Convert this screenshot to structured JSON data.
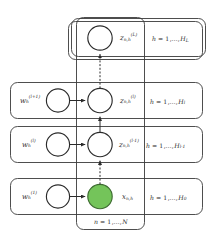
{
  "figure": {
    "type": "plate-notation-graphical-model",
    "colors": {
      "observed_node_fill": "#74c45a",
      "observed_node_stroke": "#3e6b32",
      "latent_node_fill": "#ffffff",
      "node_stroke": "#2b2b2b",
      "plate_stroke": "#3a3a3a",
      "background": "#ffffff"
    },
    "outer_plate": {
      "label_prefix": "n",
      "label_eq": "=",
      "label_start": "1",
      "label_dots": ",…,",
      "label_end": "N",
      "label_full": "n = 1,…,N"
    },
    "rows": [
      {
        "id": "layer-L",
        "weight_label": null,
        "weight_base": null,
        "weight_sub": null,
        "weight_sup": null,
        "has_weight_node": false,
        "variable_base": "z",
        "variable_sub": "n,h",
        "variable_sup": "(L)",
        "variable_full": "z_{n,h}^{(L)}",
        "observed": false,
        "plate_label_prefix": "h",
        "plate_label_eq": "=",
        "plate_label_start": "1",
        "plate_label_dots": ",…,",
        "plate_label_end": "H",
        "plate_label_end_sub": "L",
        "plate_label_full": "h = 1,…,H_L",
        "stacked": true
      },
      {
        "id": "layer-l",
        "weight_label": "w_h^{(l+1)}",
        "weight_base": "w",
        "weight_sub": "h",
        "weight_sup": "(l+1)",
        "has_weight_node": true,
        "variable_base": "z",
        "variable_sub": "n,h",
        "variable_sup": "(l)",
        "variable_full": "z_{n,h}^{(l)}",
        "observed": false,
        "plate_label_prefix": "h",
        "plate_label_eq": "=",
        "plate_label_start": "1",
        "plate_label_dots": ",…,",
        "plate_label_end": "H",
        "plate_label_end_sub": "l",
        "plate_label_full": "h = 1,…,H_l",
        "stacked": false
      },
      {
        "id": "layer-l-minus-1",
        "weight_label": "w_h^{(l)}",
        "weight_base": "w",
        "weight_sub": "h",
        "weight_sup": "(l)",
        "has_weight_node": true,
        "variable_base": "z",
        "variable_sub": "n,h",
        "variable_sup": "(l-1)",
        "variable_full": "z_{n,h}^{(l-1)}",
        "observed": false,
        "plate_label_prefix": "h",
        "plate_label_eq": "=",
        "plate_label_start": "1",
        "plate_label_dots": ",…,",
        "plate_label_end": "H",
        "plate_label_end_sub": "l-1",
        "plate_label_full": "h = 1,…,H_{l-1}",
        "stacked": false
      },
      {
        "id": "layer-0-observed",
        "weight_label": "w_h^{(1)}",
        "weight_base": "w",
        "weight_sub": "h",
        "weight_sup": "(1)",
        "has_weight_node": true,
        "variable_base": "x",
        "variable_sub": "n,h",
        "variable_sup": "",
        "variable_full": "x_{n,h}",
        "observed": true,
        "plate_label_prefix": "h",
        "plate_label_eq": "=",
        "plate_label_start": "1",
        "plate_label_dots": ",…,",
        "plate_label_end": "H",
        "plate_label_end_sub": "0",
        "plate_label_full": "h = 1,…,H_0",
        "stacked": false
      }
    ],
    "vertical_edges": [
      {
        "from": "layer-l",
        "to": "layer-L",
        "style": "dashed",
        "direction": "up"
      },
      {
        "from": "layer-l-minus-1",
        "to": "layer-l",
        "style": "solid",
        "direction": "up"
      },
      {
        "from": "layer-0-observed",
        "to": "layer-l-minus-1",
        "style": "dashed",
        "direction": "up"
      }
    ],
    "horizontal_edges": [
      {
        "row": "layer-l",
        "style": "solid",
        "direction": "right"
      },
      {
        "row": "layer-l-minus-1",
        "style": "solid",
        "direction": "right"
      },
      {
        "row": "layer-0-observed",
        "style": "solid",
        "direction": "right"
      }
    ]
  }
}
